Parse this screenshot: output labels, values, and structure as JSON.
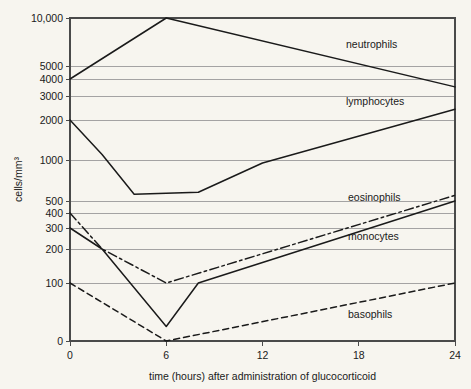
{
  "chart_data": {
    "type": "line",
    "title": "",
    "xlabel": "time (hours) after administration of glucocorticoid",
    "ylabel": "cells/mm³",
    "xlim": [
      0,
      24
    ],
    "xticks": [
      0,
      6,
      12,
      18,
      24
    ],
    "xtick_labels": [
      "0",
      "6",
      "12",
      "18",
      "24"
    ],
    "yticks": [
      0,
      100,
      200,
      300,
      400,
      500,
      1000,
      2000,
      3000,
      4000,
      5000,
      10000
    ],
    "ytick_labels": [
      "0",
      "100",
      "200",
      "300",
      "400",
      "500",
      "1000",
      "2000",
      "3000",
      "4000",
      "5000",
      "10,000"
    ],
    "y_scale": "logarithmic-with-zero-baseline",
    "grid": true,
    "grid_axis": "y",
    "legend_position": "inline-labels-right",
    "series": [
      {
        "name": "neutrophils",
        "style": "solid",
        "label": "neutrophils",
        "x": [
          0,
          6,
          24
        ],
        "values": [
          4000,
          10000,
          3500
        ]
      },
      {
        "name": "lymphocytes",
        "style": "solid",
        "label": "lymphocytes",
        "x": [
          0,
          2,
          4,
          8,
          12,
          24
        ],
        "values": [
          2000,
          1100,
          560,
          580,
          950,
          2400
        ]
      },
      {
        "name": "eosinophils",
        "style": "dash-dot",
        "label": "eosinophils",
        "x": [
          0,
          2,
          6,
          24
        ],
        "values": [
          400,
          200,
          100,
          550
        ]
      },
      {
        "name": "monocytes",
        "style": "solid",
        "label": "monocytes",
        "x": [
          0,
          2,
          6,
          8,
          24
        ],
        "values": [
          300,
          200,
          25,
          100,
          500
        ]
      },
      {
        "name": "basophils",
        "style": "dashed",
        "label": "basophils",
        "x": [
          0,
          6,
          24
        ],
        "values": [
          100,
          0,
          100
        ]
      }
    ]
  },
  "caption_ghost": "",
  "colors": {
    "background": "#f7f5ef",
    "ink": "#1a1a1a",
    "grid": "#9a9a9a",
    "frame": "#4a4a4a"
  }
}
